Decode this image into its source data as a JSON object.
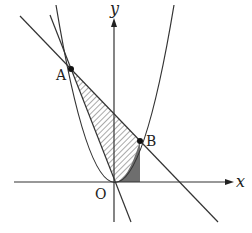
{
  "diagram": {
    "axes": {
      "x_label": "x",
      "y_label": "y",
      "origin_label": "O"
    },
    "points": [
      {
        "name": "A",
        "label": "A"
      },
      {
        "name": "B",
        "label": "B"
      }
    ],
    "curves": [
      "parabola through O, A, B",
      "line AB",
      "line OA"
    ],
    "regions": [
      {
        "name": "triangle-OAB-minus-parabola",
        "fill": "hatched"
      },
      {
        "name": "area-under-parabola-O-to-B",
        "fill": "dark-gray"
      }
    ],
    "colors": {
      "stroke": "#333333",
      "dark_fill": "#6e6e6e",
      "hatch": "#555555"
    }
  }
}
